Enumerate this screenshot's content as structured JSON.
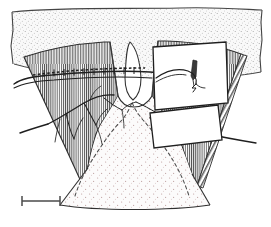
{
  "figure": {
    "width": 271,
    "height": 227,
    "background_color": "#ffffff",
    "ink_color": "#2b2b2b",
    "line_color": "#3a3a3a",
    "hatch_color": "#4a4a4a",
    "stipple_color": "#8a8a8a",
    "panel_fill": "#ffffff",
    "caption": ""
  },
  "layers": {
    "upper_stipple_band": {
      "label": "upper stippled matrix layer",
      "fill_pattern": "stipple",
      "fill_color": "#f7f7f7",
      "dot_color": "#9a9a9a"
    },
    "left_flank": {
      "label": "left hatched flank",
      "fill_pattern": "vertical-hatch",
      "hatch_color": "#4a4a4a"
    },
    "right_flank": {
      "label": "right hatched flank",
      "fill_pattern": "vertical-hatch",
      "hatch_color": "#4a4a4a"
    },
    "central_body": {
      "label": "central stippled body",
      "fill_pattern": "stipple",
      "fill_color": "#fbfbfb",
      "dot_color": "#b08a8a"
    },
    "central_lens": {
      "label": "central white lens gap",
      "fill_color": "#ffffff"
    }
  },
  "annotations": {
    "dashed_interior_outline": {
      "label": "dashed interior boundary",
      "style": "dashed",
      "color": "#4a4a4a"
    },
    "stitch_line": {
      "label": "horizontal dashed stitch marker",
      "style": "dashed",
      "color": "#2b2b2b"
    },
    "branching_structure": {
      "label": "branching vessel structure",
      "color": "#2b2b2b"
    },
    "long_curve_left": {
      "label": "long curved filament left",
      "color": "#2b2b2b"
    },
    "long_curve_right": {
      "label": "long curved filament right",
      "color": "#2b2b2b"
    }
  },
  "inset_panels": [
    {
      "name": "upper-inset-panel",
      "label": "upper inset detail panel",
      "fill": "#ffffff",
      "border_color": "#2b2b2b",
      "contents": {
        "spike_glyph": "elongated spike marker",
        "hook_glyph": "curved forked filament"
      }
    },
    {
      "name": "lower-inset-panel",
      "label": "lower inset detail panel",
      "fill": "#ffffff",
      "border_color": "#2b2b2b",
      "contents": {}
    }
  ],
  "scale_bar": {
    "label": "",
    "style": "I-beam",
    "color": "#4a4a4a",
    "x_start": 22,
    "x_end": 60,
    "y": 201
  }
}
